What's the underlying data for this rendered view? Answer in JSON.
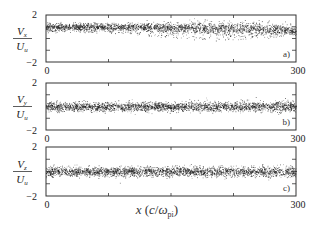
{
  "chart_data": [
    {
      "type": "scatter",
      "panel": "a)",
      "ylabel": {
        "num": "V",
        "num_sub": "x",
        "den": "U",
        "den_sub": "u"
      },
      "xlabel": "",
      "xlim": [
        0,
        300
      ],
      "ylim": [
        -2,
        2
      ],
      "x_tick_labels": [
        "0",
        "300"
      ],
      "y_tick_labels": [
        "2",
        "−2"
      ],
      "x_minor_ticks": [
        75,
        150,
        225
      ],
      "y_minor_ticks": [
        -1,
        0,
        1
      ],
      "description": "Dense particle cloud centered near +1 with spread ~±0.3; lower tail extending toward 0 between x≈120 and x≈260",
      "profile": [
        {
          "x": 0,
          "center": 1.0,
          "spread": 0.3,
          "tail_low": 0.5
        },
        {
          "x": 50,
          "center": 1.0,
          "spread": 0.3,
          "tail_low": 0.5
        },
        {
          "x": 100,
          "center": 1.0,
          "spread": 0.3,
          "tail_low": 0.4
        },
        {
          "x": 150,
          "center": 0.95,
          "spread": 0.35,
          "tail_low": 0.0
        },
        {
          "x": 200,
          "center": 0.9,
          "spread": 0.45,
          "tail_low": -0.2
        },
        {
          "x": 250,
          "center": 0.85,
          "spread": 0.5,
          "tail_low": 0.0
        },
        {
          "x": 300,
          "center": 0.7,
          "spread": 0.35,
          "tail_low": 0.3
        }
      ]
    },
    {
      "type": "scatter",
      "panel": "b)",
      "ylabel": {
        "num": "V",
        "num_sub": "y",
        "den": "U",
        "den_sub": "u"
      },
      "xlabel": "",
      "xlim": [
        0,
        300
      ],
      "ylim": [
        -2,
        2
      ],
      "x_tick_labels": [
        "0",
        "300"
      ],
      "y_tick_labels": [
        "2",
        "−2"
      ],
      "x_minor_ticks": [
        75,
        150,
        225
      ],
      "y_minor_ticks": [
        -1,
        0,
        1
      ],
      "description": "Particle cloud centered at 0 with spread ~±0.35, slightly denser toward right",
      "profile": [
        {
          "x": 0,
          "center": 0.0,
          "spread": 0.35
        },
        {
          "x": 150,
          "center": 0.0,
          "spread": 0.35
        },
        {
          "x": 300,
          "center": 0.0,
          "spread": 0.4
        }
      ]
    },
    {
      "type": "scatter",
      "panel": "c)",
      "ylabel": {
        "num": "V",
        "num_sub": "z",
        "den": "U",
        "den_sub": "u"
      },
      "xlabel": "x (c/ω_pi)",
      "xlim": [
        0,
        300
      ],
      "ylim": [
        -2,
        2
      ],
      "x_tick_labels": [
        "0",
        "300"
      ],
      "y_tick_labels": [
        "2",
        "−2"
      ],
      "x_minor_ticks": [
        75,
        150,
        225
      ],
      "y_minor_ticks": [
        -1,
        0,
        1
      ],
      "description": "Particle cloud centered at 0 with spread ~±0.35",
      "profile": [
        {
          "x": 0,
          "center": 0.0,
          "spread": 0.35
        },
        {
          "x": 150,
          "center": 0.0,
          "spread": 0.35
        },
        {
          "x": 300,
          "center": 0.0,
          "spread": 0.4
        }
      ]
    }
  ],
  "xaxis_label": {
    "var": "x",
    "unit_open": "(",
    "unit_c": "c",
    "unit_slash": "/",
    "unit_omega": "ω",
    "unit_sub": "pi",
    "unit_close": ")"
  }
}
